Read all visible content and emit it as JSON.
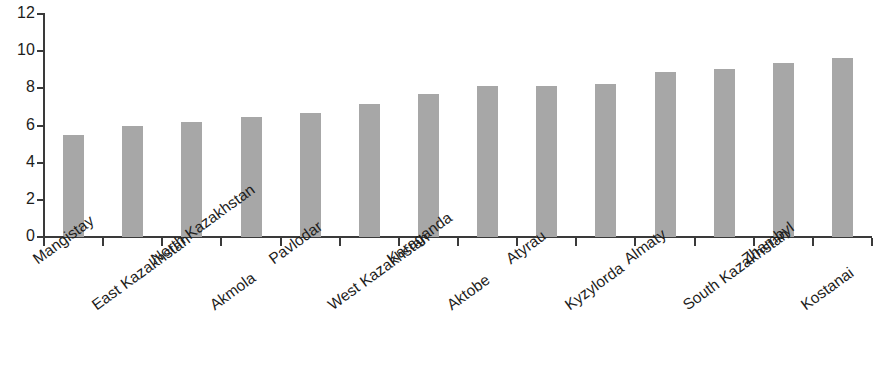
{
  "chart_data": {
    "type": "bar",
    "title": "",
    "subtitle": "",
    "xlabel": "",
    "ylabel": "",
    "ylim": [
      0,
      12
    ],
    "y_ticks": [
      0,
      2,
      4,
      6,
      8,
      10,
      12
    ],
    "grid": false,
    "legend": false,
    "bar_color": "#a7a7a7",
    "axis_color": "#3a3a3a",
    "text_color": "#1d1d1b",
    "categories": [
      "Mangistay",
      "East Kazakhstan",
      "North Kazakhstan",
      "Akmola",
      "Pavlodar",
      "West Kazakhstan",
      "Karaganda",
      "Aktobe",
      "Atyrau",
      "Kyzylorda",
      "Almaty",
      "South Kazakhstan",
      "Zhambyl",
      "Kostanai"
    ],
    "values": [
      5.5,
      6.0,
      6.2,
      6.45,
      6.7,
      7.15,
      7.7,
      8.1,
      8.1,
      8.25,
      8.9,
      9.05,
      9.35,
      9.65
    ]
  }
}
